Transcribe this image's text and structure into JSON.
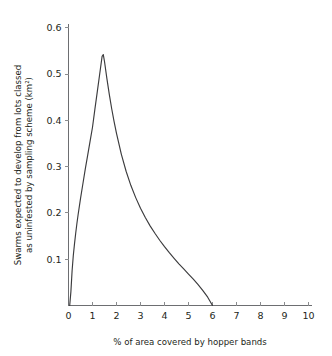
{
  "chart_data": {
    "type": "line",
    "title": "",
    "xlabel": "% of area covered by hopper bands",
    "ylabel_line1": "Swarms expected to develop from lots classed",
    "ylabel_line2": "as uninfested by sampling scheme (km²)",
    "xlim": [
      0,
      10
    ],
    "ylim": [
      0,
      0.62
    ],
    "grid": false,
    "legend": "none",
    "xticks": [
      0,
      1,
      2,
      3,
      4,
      5,
      6,
      7,
      8,
      9,
      10
    ],
    "xtick_labels": [
      "0",
      "1",
      "2",
      "3",
      "4",
      "5",
      "6",
      "7",
      "8",
      "9",
      "10"
    ],
    "yticks": [
      0.1,
      0.2,
      0.3,
      0.4,
      0.5,
      0.6
    ],
    "ytick_labels": [
      "0.1",
      "0.2",
      "0.3",
      "0.4",
      "0.5",
      "0.6"
    ],
    "peak": {
      "x": 1.4,
      "y": 0.542
    },
    "zero_crossing_x": 6.0,
    "series": [
      {
        "name": "expected swarms",
        "color": "#3b3b3d",
        "x": [
          0.05,
          0.1,
          0.15,
          0.2,
          0.25,
          0.3,
          0.35,
          0.4,
          0.5,
          0.6,
          0.7,
          0.8,
          0.9,
          1.0,
          1.1,
          1.2,
          1.3,
          1.4,
          1.45,
          1.5,
          1.6,
          1.7,
          1.8,
          1.9,
          2.0,
          2.2,
          2.4,
          2.6,
          2.8,
          3.0,
          3.2,
          3.4,
          3.6,
          3.8,
          4.0,
          4.2,
          4.4,
          4.6,
          4.8,
          5.0,
          5.2,
          5.4,
          5.6,
          5.8,
          6.0
        ],
        "y": [
          0.0,
          0.03,
          0.075,
          0.108,
          0.133,
          0.156,
          0.177,
          0.196,
          0.231,
          0.263,
          0.295,
          0.325,
          0.355,
          0.385,
          0.424,
          0.462,
          0.5,
          0.538,
          0.542,
          0.527,
          0.49,
          0.456,
          0.425,
          0.397,
          0.372,
          0.327,
          0.29,
          0.259,
          0.233,
          0.21,
          0.19,
          0.172,
          0.156,
          0.141,
          0.127,
          0.114,
          0.102,
          0.09,
          0.079,
          0.068,
          0.057,
          0.045,
          0.032,
          0.018,
          0.0
        ]
      }
    ]
  },
  "colors": {
    "curve": "#3b3b3d",
    "axis": "#6d6e71",
    "text": "#231f20",
    "background": "#ffffff"
  }
}
